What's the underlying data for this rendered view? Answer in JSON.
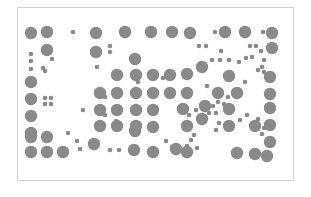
{
  "figure": {
    "frame": {
      "x": 17,
      "y": 7,
      "width": 277,
      "height": 174,
      "border_color": "#d2d2d2"
    },
    "dot_color": "#8a8a8a",
    "large_radius": 6.2,
    "small_radius": 2.3,
    "large_dots": [
      [
        31,
        33
      ],
      [
        47,
        32
      ],
      [
        96,
        33
      ],
      [
        125,
        32
      ],
      [
        151,
        32
      ],
      [
        172,
        32
      ],
      [
        190,
        33
      ],
      [
        225,
        32
      ],
      [
        245,
        32
      ],
      [
        272,
        33
      ],
      [
        47,
        50
      ],
      [
        96,
        52
      ],
      [
        135,
        59
      ],
      [
        272,
        48
      ],
      [
        31,
        82
      ],
      [
        117,
        75
      ],
      [
        136,
        75
      ],
      [
        153,
        75
      ],
      [
        170,
        75
      ],
      [
        187,
        74
      ],
      [
        202,
        67
      ],
      [
        229,
        76
      ],
      [
        270,
        77
      ],
      [
        31,
        99
      ],
      [
        100,
        93
      ],
      [
        117,
        93
      ],
      [
        136,
        93
      ],
      [
        153,
        93
      ],
      [
        170,
        93
      ],
      [
        187,
        93
      ],
      [
        218,
        93
      ],
      [
        237,
        93
      ],
      [
        270,
        94
      ],
      [
        31,
        116
      ],
      [
        100,
        110
      ],
      [
        117,
        110
      ],
      [
        136,
        110
      ],
      [
        153,
        110
      ],
      [
        183,
        109
      ],
      [
        205,
        106
      ],
      [
        229,
        109
      ],
      [
        270,
        108
      ],
      [
        31,
        133
      ],
      [
        100,
        126
      ],
      [
        117,
        126
      ],
      [
        136,
        126
      ],
      [
        153,
        127
      ],
      [
        187,
        126
      ],
      [
        202,
        119
      ],
      [
        229,
        126
      ],
      [
        255,
        126
      ],
      [
        270,
        125
      ],
      [
        31,
        137
      ],
      [
        47,
        137
      ],
      [
        94,
        144
      ],
      [
        135,
        131
      ],
      [
        270,
        142
      ],
      [
        31,
        152
      ],
      [
        47,
        152
      ],
      [
        63,
        152
      ],
      [
        134,
        150
      ],
      [
        153,
        152
      ],
      [
        176,
        149
      ],
      [
        187,
        152
      ],
      [
        237,
        153
      ],
      [
        255,
        154
      ],
      [
        267,
        156
      ]
    ],
    "small_dots": [
      [
        73,
        32
      ],
      [
        110,
        46
      ],
      [
        110,
        52
      ],
      [
        215,
        32
      ],
      [
        263,
        32
      ],
      [
        31,
        54
      ],
      [
        31,
        61
      ],
      [
        31,
        69
      ],
      [
        52,
        59
      ],
      [
        45,
        71
      ],
      [
        97,
        67
      ],
      [
        199,
        46
      ],
      [
        206,
        46
      ],
      [
        221,
        51
      ],
      [
        250,
        46
      ],
      [
        256,
        46
      ],
      [
        261,
        51
      ],
      [
        212,
        60
      ],
      [
        220,
        60
      ],
      [
        229,
        60
      ],
      [
        239,
        62
      ],
      [
        246,
        58
      ],
      [
        252,
        57
      ],
      [
        264,
        60
      ],
      [
        264,
        72
      ],
      [
        262,
        67
      ],
      [
        43,
        68
      ],
      [
        45,
        98
      ],
      [
        51,
        98
      ],
      [
        45,
        104
      ],
      [
        51,
        104
      ],
      [
        83,
        110
      ],
      [
        105,
        97
      ],
      [
        116,
        121
      ],
      [
        230,
        72
      ],
      [
        258,
        70
      ],
      [
        245,
        82
      ],
      [
        138,
        82
      ],
      [
        163,
        78
      ],
      [
        207,
        86
      ],
      [
        213,
        106
      ],
      [
        218,
        102
      ],
      [
        224,
        104
      ],
      [
        228,
        97
      ],
      [
        240,
        120
      ],
      [
        247,
        115
      ],
      [
        258,
        119
      ],
      [
        262,
        134
      ],
      [
        264,
        128
      ],
      [
        68,
        133
      ],
      [
        77,
        141
      ],
      [
        80,
        149
      ],
      [
        110,
        150
      ],
      [
        119,
        150
      ],
      [
        166,
        141
      ],
      [
        172,
        147
      ],
      [
        187,
        146
      ],
      [
        191,
        140
      ],
      [
        194,
        135
      ],
      [
        197,
        148
      ],
      [
        185,
        111
      ],
      [
        189,
        115
      ],
      [
        196,
        110
      ],
      [
        209,
        113
      ],
      [
        216,
        113
      ],
      [
        219,
        123
      ],
      [
        216,
        130
      ],
      [
        105,
        115
      ]
    ]
  }
}
